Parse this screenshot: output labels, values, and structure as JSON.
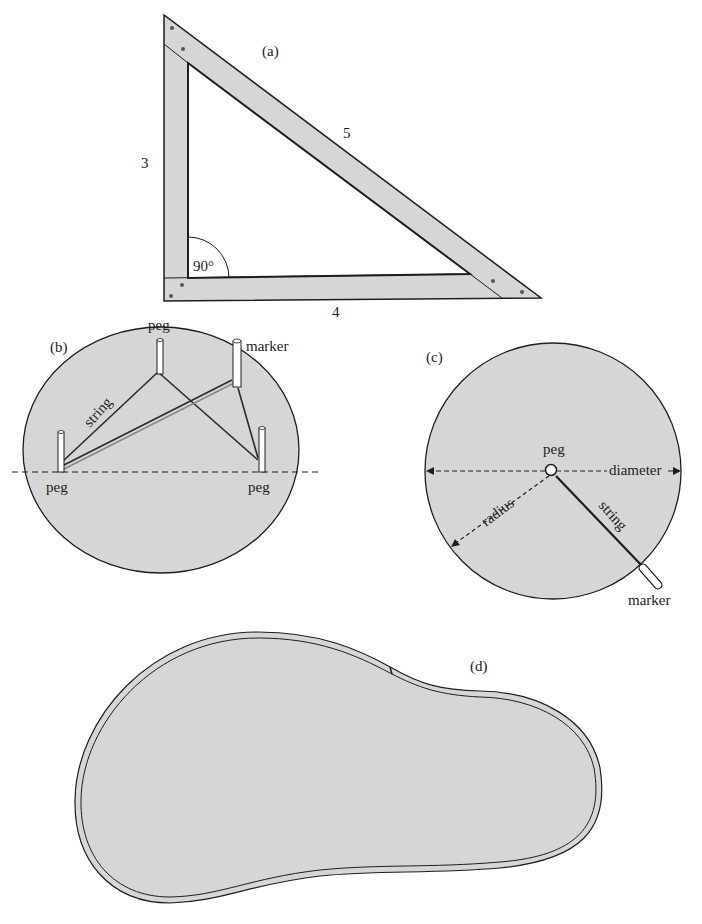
{
  "colors": {
    "fill": "#d6d6d6",
    "stroke": "#1e1e1e",
    "background": "#ffffff"
  },
  "panel_a": {
    "label": "(a)",
    "side_vertical": "3",
    "side_horizontal": "4",
    "side_hypotenuse": "5",
    "angle": "90°"
  },
  "panel_b": {
    "label": "(b)",
    "peg_top": "peg",
    "marker": "marker",
    "string": "string",
    "peg_left": "peg",
    "peg_right": "peg"
  },
  "panel_c": {
    "label": "(c)",
    "peg": "peg",
    "diameter": "diameter",
    "radius": "radius",
    "string": "string",
    "marker": "marker"
  },
  "panel_d": {
    "label": "(d)"
  }
}
